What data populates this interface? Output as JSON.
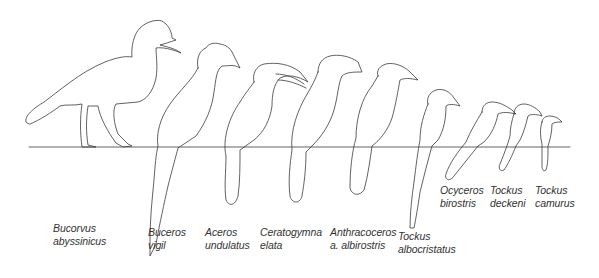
{
  "figure": {
    "line_color": "#3a3a3a",
    "background": "#ffffff",
    "species": [
      {
        "genus": "Bucorvus",
        "epithet": "abyssinicus",
        "x": 53,
        "y": 222
      },
      {
        "genus": "Buceros",
        "epithet": "vigil",
        "x": 148,
        "y": 226
      },
      {
        "genus": "Aceros",
        "epithet": "undulatus",
        "x": 205,
        "y": 226
      },
      {
        "genus": "Ceratogymna",
        "epithet": "elata",
        "x": 260,
        "y": 226
      },
      {
        "genus": "Anthracoceros",
        "epithet": "a. albirostris",
        "x": 330,
        "y": 226
      },
      {
        "genus": "Tockus",
        "epithet": "albocristatus",
        "x": 398,
        "y": 230
      },
      {
        "genus": "Ocyceros",
        "epithet": "birostris",
        "x": 440,
        "y": 184
      },
      {
        "genus": "Tockus",
        "epithet": "deckeni",
        "x": 490,
        "y": 184
      },
      {
        "genus": "Tockus",
        "epithet": "camurus",
        "x": 535,
        "y": 184
      }
    ]
  }
}
